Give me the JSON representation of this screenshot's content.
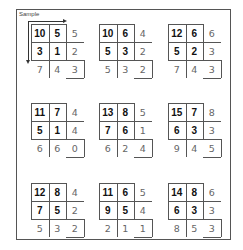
{
  "sample_label": "Sample",
  "puzzles": [
    {
      "cells": [
        "10",
        "5",
        "5",
        "3",
        "1",
        "2",
        "7",
        "4",
        "3"
      ]
    },
    {
      "cells": [
        "10",
        "6",
        "4",
        "5",
        "3",
        "2",
        "5",
        "3",
        "2"
      ]
    },
    {
      "cells": [
        "12",
        "6",
        "6",
        "5",
        "2",
        "3",
        "7",
        "4",
        "3"
      ]
    },
    {
      "cells": [
        "11",
        "7",
        "4",
        "5",
        "1",
        "4",
        "6",
        "6",
        "0"
      ]
    },
    {
      "cells": [
        "13",
        "8",
        "5",
        "7",
        "6",
        "1",
        "6",
        "2",
        "4"
      ]
    },
    {
      "cells": [
        "15",
        "7",
        "8",
        "6",
        "3",
        "3",
        "9",
        "4",
        "5"
      ]
    },
    {
      "cells": [
        "12",
        "8",
        "4",
        "7",
        "5",
        "2",
        "5",
        "3",
        "2"
      ]
    },
    {
      "cells": [
        "11",
        "6",
        "5",
        "9",
        "5",
        "4",
        "2",
        "1",
        "1"
      ]
    },
    {
      "cells": [
        "14",
        "8",
        "6",
        "6",
        "3",
        "3",
        "8",
        "5",
        "3"
      ]
    }
  ],
  "colors": {
    "line": "#555555",
    "bold_text": "#111111",
    "light_text": "#666666"
  }
}
